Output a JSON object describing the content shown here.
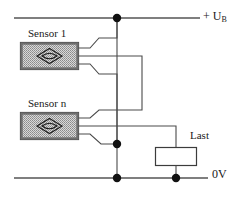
{
  "diagram": {
    "type": "electrical-schematic",
    "background_color": "#ffffff",
    "line_color": "#4a4a4a",
    "node_color": "#111111",
    "labels": {
      "supply_prefix": "+ U",
      "supply_subscript": "B",
      "ground": "0V",
      "sensor_1": "Sensor 1",
      "sensor_n": "Sensor n",
      "load": "Last"
    },
    "rails": [
      {
        "name": "supply-rail",
        "label": "+ UB",
        "y": 18
      },
      {
        "name": "ground-rail",
        "label": "0V",
        "y": 178
      }
    ],
    "components": [
      {
        "name": "sensor-1",
        "label": "Sensor 1",
        "symbol": "proximity-switch-diamond",
        "x": 20,
        "y": 42,
        "width": 58,
        "height": 28,
        "wire_count": 3
      },
      {
        "name": "sensor-n",
        "label": "Sensor n",
        "symbol": "proximity-switch-diamond",
        "x": 20,
        "y": 112,
        "width": 58,
        "height": 28,
        "wire_count": 3
      },
      {
        "name": "load",
        "label": "Last",
        "symbol": "resistor-rectangle",
        "x": 155,
        "y": 147,
        "width": 42,
        "height": 19
      }
    ],
    "junctions": [
      {
        "name": "supply-node",
        "x": 117,
        "y": 18
      },
      {
        "name": "signal-node",
        "x": 117,
        "y": 144
      },
      {
        "name": "ground-node-signal",
        "x": 117,
        "y": 178
      },
      {
        "name": "ground-node-load",
        "x": 176,
        "y": 178
      }
    ]
  }
}
